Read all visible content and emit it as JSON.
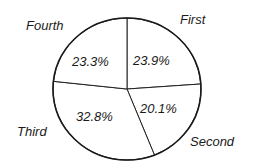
{
  "chart_data": {
    "type": "pie",
    "title": "",
    "start": "top",
    "direction": "clockwise",
    "slices": [
      {
        "label": "First",
        "value": 23.9,
        "value_label": "23.9%"
      },
      {
        "label": "Second",
        "value": 20.1,
        "value_label": "20.1%"
      },
      {
        "label": "Third",
        "value": 32.8,
        "value_label": "32.8%"
      },
      {
        "label": "Fourth",
        "value": 23.3,
        "value_label": "23.3%"
      }
    ],
    "colors": {
      "fill": "#ffffff",
      "stroke": "#1a1a1a",
      "text": "#1a1a1a"
    }
  }
}
